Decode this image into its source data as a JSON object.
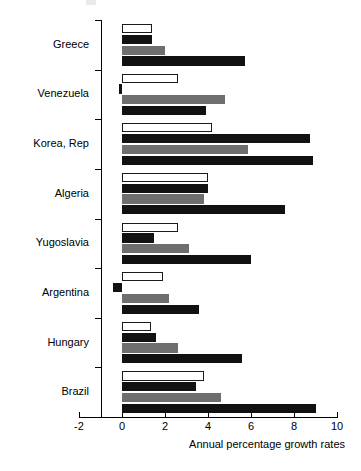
{
  "chart_data": {
    "type": "bar",
    "orientation": "horizontal",
    "title": "",
    "xlabel": "Annual percentage growth rates",
    "ylabel": "",
    "xlim": [
      -2,
      10
    ],
    "xticks": [
      -2,
      0,
      2,
      4,
      6,
      8,
      10
    ],
    "xtick_labels": [
      "-2",
      "0",
      "2",
      "4",
      "6",
      "8",
      "10"
    ],
    "grid": false,
    "legend": false,
    "categories": [
      "Greece",
      "Venezuela",
      "Korea, Rep",
      "Algeria",
      "Yugoslavia",
      "Argentina",
      "Hungary",
      "Brazil"
    ],
    "series": [
      {
        "name": "series-1",
        "style": "open-white",
        "color": "#ffffff",
        "values": [
          1.4,
          2.6,
          4.2,
          4.0,
          2.6,
          1.9,
          1.35,
          3.8
        ]
      },
      {
        "name": "series-2",
        "style": "solid-black",
        "color": "#121212",
        "values": [
          1.4,
          -0.15,
          8.75,
          4.0,
          1.5,
          -0.4,
          1.6,
          3.45
        ]
      },
      {
        "name": "series-3",
        "style": "solid-grey",
        "color": "#6e6e6e",
        "values": [
          2.0,
          4.8,
          5.85,
          3.8,
          3.1,
          2.2,
          2.6,
          4.6
        ]
      },
      {
        "name": "series-4",
        "style": "solid-black",
        "color": "#111111",
        "values": [
          5.7,
          3.9,
          8.9,
          7.6,
          6.0,
          3.6,
          5.6,
          9.0
        ]
      }
    ]
  },
  "axis": {
    "x_title": "Annual percentage growth rates"
  }
}
